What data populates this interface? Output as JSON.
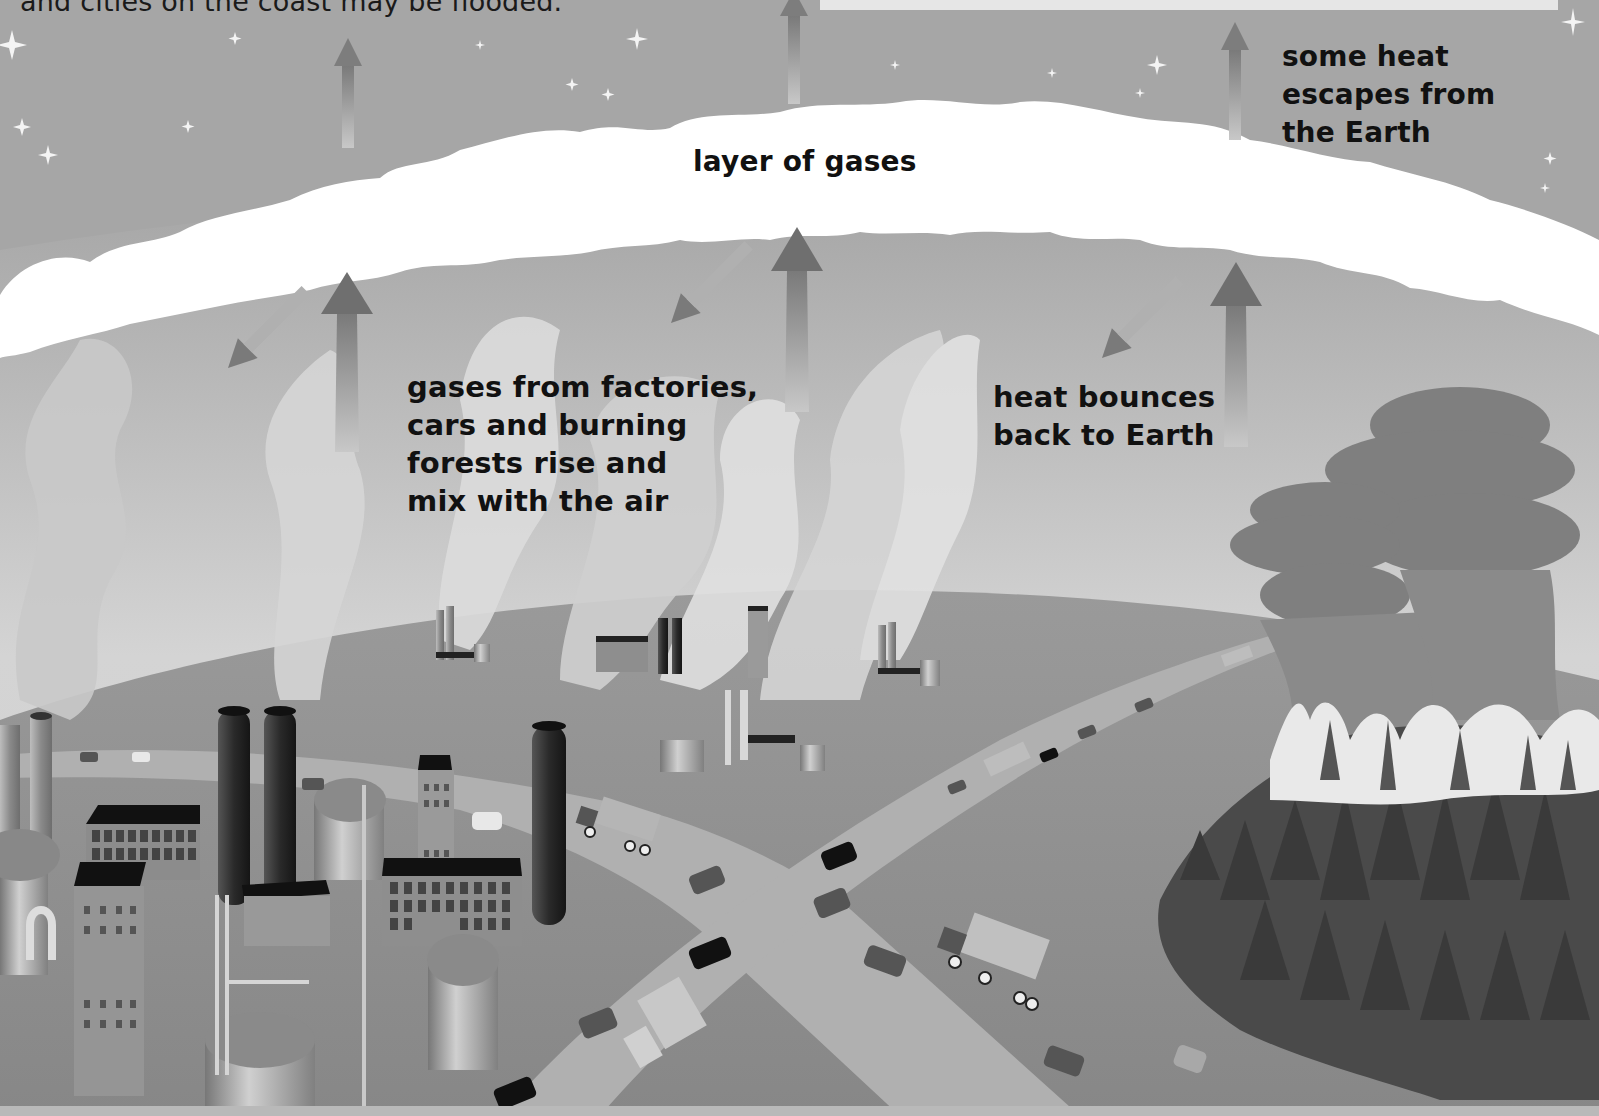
{
  "figure": {
    "top_caption": "and cities on the coast may be flooded.",
    "labels": {
      "escape": [
        "some heat",
        "escapes from",
        "the Earth"
      ],
      "layer": "layer of gases",
      "gases": [
        "gases from factories,",
        "cars and burning",
        "forests rise and",
        "mix with the air"
      ],
      "bounce": [
        "heat bounces",
        "back to Earth"
      ]
    },
    "elements": {
      "sky": "starry night sky",
      "gas_layer": "white band of gases",
      "arrows_up": "heat rising arrows",
      "arrows_down": "heat bouncing-back arrows",
      "factories": "factories with smokestacks",
      "highway": "highway with cars and trucks",
      "forest_fire": "burning forest with smoke clouds"
    },
    "colors": {
      "sky": "#a6a6a6",
      "gas_layer": "#ffffff",
      "earth": "#8f8f8f",
      "road": "#b3b3b3",
      "smokestack": "#2e2e2e",
      "forest": "#4a4a4a",
      "text": "#111111"
    }
  }
}
